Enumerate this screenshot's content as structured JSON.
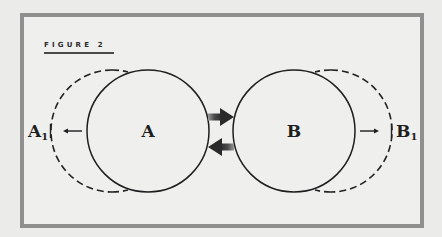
{
  "figure": {
    "title": "FIGURE 2"
  },
  "diagram": {
    "circles": [
      {
        "id": "A",
        "label": "A",
        "style": "solid",
        "cx": 148,
        "cy": 131,
        "r": 61
      },
      {
        "id": "B",
        "label": "B",
        "style": "solid",
        "cx": 294,
        "cy": 131,
        "r": 61
      },
      {
        "id": "A1",
        "label": "A",
        "subscript": "1",
        "style": "dashed",
        "cx": 112,
        "cy": 131,
        "r": 61
      },
      {
        "id": "B1",
        "label": "B",
        "subscript": "1",
        "style": "dashed",
        "cx": 331,
        "cy": 131,
        "r": 61
      }
    ],
    "arrows": [
      {
        "id": "A-to-A1",
        "direction": "left",
        "description": "A moves outward to A1"
      },
      {
        "id": "B-to-B1",
        "direction": "right",
        "description": "B moves outward to B1"
      },
      {
        "id": "A-to-B",
        "direction": "right",
        "style": "bold"
      },
      {
        "id": "B-to-A",
        "direction": "left",
        "style": "bold"
      }
    ],
    "labels": {
      "a": "A",
      "b": "B",
      "a1_base": "A",
      "a1_sub": "1",
      "b1_base": "B",
      "b1_sub": "1"
    }
  },
  "colors": {
    "background": "#ebebea",
    "frame_border": "#8f8f8f",
    "ink": "#1e1e1e",
    "bold_arrow": "#3a3a3a"
  }
}
